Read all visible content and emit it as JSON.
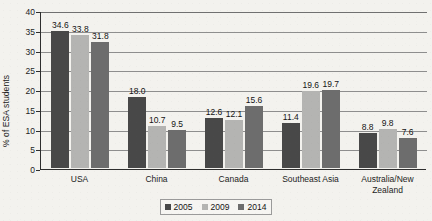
{
  "chart_data": {
    "type": "bar",
    "title": "",
    "subtitle": "",
    "xlabel": "",
    "ylabel": "% of ESA students",
    "ylim": [
      0,
      40
    ],
    "ytick_step": 5,
    "yticks": [
      "0",
      "5",
      "10",
      "15",
      "20",
      "25",
      "30",
      "35",
      "40"
    ],
    "grid": "horizontal",
    "legend_position": "bottom-center",
    "categories": [
      "USA",
      "China",
      "Canada",
      "Southeast Asia",
      "Australia/New Zealand"
    ],
    "series": [
      {
        "name": "2005",
        "color": "#484848",
        "values": [
          34.6,
          18.0,
          12.6,
          11.4,
          8.8
        ],
        "labels": [
          "34.6",
          "18.0",
          "12.6",
          "11.4",
          "8.8"
        ]
      },
      {
        "name": "2009",
        "color": "#b4b4b2",
        "values": [
          33.8,
          10.7,
          12.1,
          19.6,
          9.8
        ],
        "labels": [
          "33.8",
          "10.7",
          "12.1",
          "19.6",
          "9.8"
        ]
      },
      {
        "name": "2014",
        "color": "#6d6d6d",
        "values": [
          31.8,
          9.5,
          15.6,
          19.7,
          7.6
        ],
        "labels": [
          "31.8",
          "9.5",
          "15.6",
          "19.7",
          "7.6"
        ]
      }
    ]
  },
  "category_label_lines": [
    [
      "USA"
    ],
    [
      "China"
    ],
    [
      "Canada"
    ],
    [
      "Southeast Asia"
    ],
    [
      "Australia/New",
      "Zealand"
    ]
  ],
  "colors": {
    "background": "#f3f2ee",
    "axis": "#2e2e2e",
    "gridline": "#8e8e8e",
    "text": "#1d1d1d",
    "legend_border": "#9a9a9a"
  }
}
